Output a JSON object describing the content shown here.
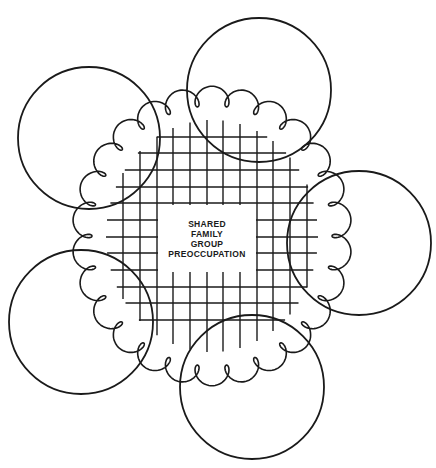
{
  "diagram": {
    "center_label": [
      "SHARED",
      "FAMILY",
      "GROUP",
      "PREOCCUPATION"
    ],
    "center_box": {
      "x": 158,
      "y": 205,
      "w": 98,
      "h": 67
    },
    "stroke_color": "#1a1a1a",
    "background": "#ffffff",
    "member_circles": [
      {
        "id": "top-right",
        "cx": 259,
        "cy": 90,
        "r": 72
      },
      {
        "id": "top-left",
        "cx": 89,
        "cy": 138,
        "r": 71
      },
      {
        "id": "right",
        "cx": 359,
        "cy": 243,
        "r": 72
      },
      {
        "id": "bottom-left",
        "cx": 81,
        "cy": 322,
        "r": 72
      },
      {
        "id": "bottom",
        "cx": 252,
        "cy": 387,
        "r": 72
      }
    ],
    "loop_boundary": {
      "cx": 212,
      "cy": 236,
      "rx": 120,
      "ry": 130,
      "loops": 26
    },
    "grid": {
      "verticals": [
        123,
        140,
        157,
        173,
        190,
        207,
        223,
        240,
        257,
        273,
        290,
        307
      ],
      "horizontals": [
        137,
        153,
        170,
        187,
        203,
        220,
        237,
        253,
        270,
        287,
        303,
        320
      ]
    }
  }
}
